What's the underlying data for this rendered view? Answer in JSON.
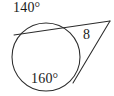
{
  "figure": {
    "kind": "circle-secant-tangent-diagram",
    "background_color": "#ffffff",
    "stroke_color": "#2b2b2b",
    "labels": {
      "arc_major_top": "140°",
      "arc_major_bottom": "160°",
      "segment_length": "8"
    },
    "circle": {
      "center_x": 46,
      "center_y": 57,
      "radius": 34
    },
    "external_vertex": {
      "x": 110,
      "y": 21
    },
    "secant_line": {
      "near_intersection_x": 78,
      "near_intersection_y": 30,
      "far_intersection_x": 14,
      "far_intersection_y": 35
    },
    "tangent_line": {
      "touch_x": 73,
      "touch_y": 83
    }
  }
}
